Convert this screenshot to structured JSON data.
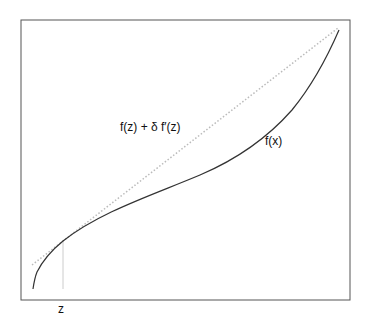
{
  "diagram": {
    "labels": {
      "tangent": "f(z) + δ f′(z)",
      "function": "f(x)",
      "point": "z"
    },
    "colors": {
      "frame": "#555555",
      "curve": "#333333",
      "tangent": "#bbbbbb",
      "marker": "#cccccc"
    }
  }
}
